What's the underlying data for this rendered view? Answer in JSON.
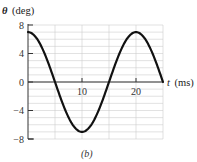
{
  "figure": {
    "caption": "(b)"
  },
  "chart_data": {
    "type": "line",
    "title": "",
    "ylabel": "θ (deg)",
    "ylabel_symbol": "θ",
    "ylabel_unit": "(deg)",
    "xlabel": "t (ms)",
    "xlabel_symbol": "t",
    "xlabel_unit": "(ms)",
    "xlim": [
      0,
      25
    ],
    "ylim": [
      -8,
      8
    ],
    "x_ticks": [
      10,
      20
    ],
    "x_tick_labels": [
      "10",
      "20"
    ],
    "y_ticks": [
      8,
      4,
      0,
      -4,
      -8
    ],
    "y_tick_labels": [
      "8",
      "4",
      "0",
      "−4",
      "−8"
    ],
    "grid": true,
    "grid_x_step": 5,
    "grid_y_step": 1,
    "legend": null,
    "series": [
      {
        "name": "θ(t)",
        "description": "sinusoid θ = 7 cos(2πt/20)",
        "amplitude": 7,
        "period": 20,
        "x": [
          0,
          1.25,
          2.5,
          3.75,
          5,
          6.25,
          7.5,
          8.75,
          10,
          11.25,
          12.5,
          13.75,
          15,
          16.25,
          17.5,
          18.75,
          20,
          21.25,
          22.5,
          23.75,
          25
        ],
        "values": [
          7,
          6.47,
          4.95,
          2.68,
          0,
          -2.68,
          -4.95,
          -6.47,
          -7,
          -6.47,
          -4.95,
          -2.68,
          0,
          2.68,
          4.95,
          6.47,
          7,
          6.47,
          4.95,
          2.68,
          0
        ]
      }
    ]
  },
  "colors": {
    "curve": "#111111",
    "axis": "#333333",
    "grid": "#cfcfcf"
  }
}
